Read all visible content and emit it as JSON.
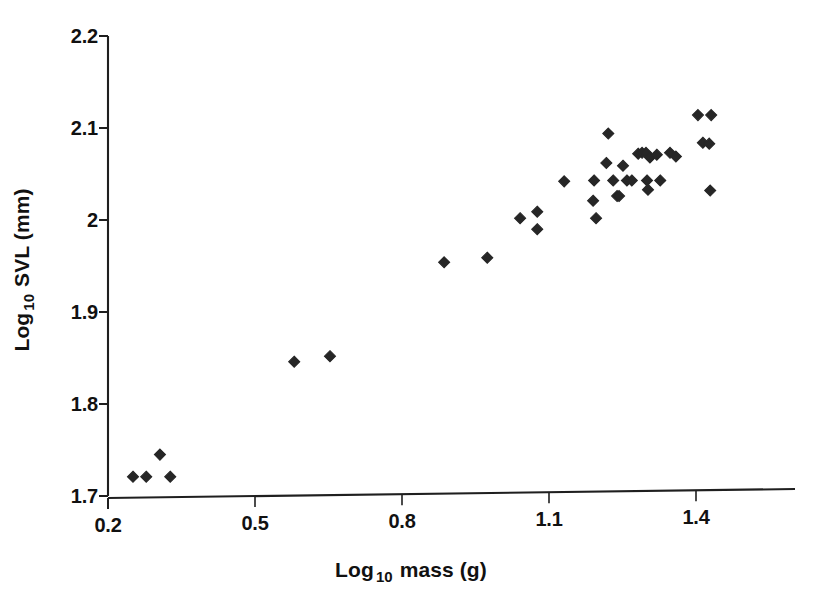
{
  "chart_data": {
    "type": "scatter",
    "title": "",
    "xlabel": "Log 10 mass (g)",
    "xlabel_base": "Log",
    "xlabel_sub": "10",
    "xlabel_rest": " mass (g)",
    "ylabel": "Log 10 SVL (mm)",
    "ylabel_base": "Log",
    "ylabel_sub": "10",
    "ylabel_rest": " SVL (mm)",
    "xlim": [
      0.2,
      1.6
    ],
    "ylim": [
      1.7,
      2.2
    ],
    "xticks": [
      0.2,
      0.5,
      0.8,
      1.1,
      1.4
    ],
    "xtick_labels": [
      "0.2",
      "0.5",
      "0.8",
      "1.1",
      "1.4"
    ],
    "yticks": [
      1.7,
      1.8,
      1.9,
      2.0,
      2.1,
      2.2
    ],
    "ytick_labels": [
      "1.7",
      "1.8",
      "1.9",
      "2",
      "2.1",
      "2.2"
    ],
    "grid": false,
    "legend": null,
    "marker": "diamond",
    "marker_color": "#262626",
    "marker_size": 11,
    "points": [
      [
        0.251,
        1.721
      ],
      [
        0.278,
        1.721
      ],
      [
        0.306,
        1.745
      ],
      [
        0.327,
        1.721
      ],
      [
        0.58,
        1.846
      ],
      [
        0.653,
        1.852
      ],
      [
        0.886,
        1.954
      ],
      [
        0.974,
        1.959
      ],
      [
        1.041,
        2.002
      ],
      [
        1.076,
        2.009
      ],
      [
        1.076,
        1.99
      ],
      [
        1.131,
        2.042
      ],
      [
        1.192,
        2.043
      ],
      [
        1.19,
        2.021
      ],
      [
        1.196,
        2.002
      ],
      [
        1.217,
        2.062
      ],
      [
        1.221,
        2.094
      ],
      [
        1.231,
        2.043
      ],
      [
        1.239,
        2.026
      ],
      [
        1.243,
        2.026
      ],
      [
        1.251,
        2.059
      ],
      [
        1.259,
        2.043
      ],
      [
        1.269,
        2.043
      ],
      [
        1.282,
        2.072
      ],
      [
        1.29,
        2.073
      ],
      [
        1.298,
        2.073
      ],
      [
        1.3,
        2.043
      ],
      [
        1.302,
        2.033
      ],
      [
        1.306,
        2.068
      ],
      [
        1.32,
        2.071
      ],
      [
        1.327,
        2.043
      ],
      [
        1.347,
        2.073
      ],
      [
        1.359,
        2.069
      ],
      [
        1.404,
        2.114
      ],
      [
        1.431,
        2.114
      ],
      [
        1.414,
        2.084
      ],
      [
        1.427,
        2.083
      ],
      [
        1.429,
        2.032
      ]
    ]
  },
  "figure": {
    "background_color": "#ffffff",
    "axis_color": "#1f1f1f"
  }
}
